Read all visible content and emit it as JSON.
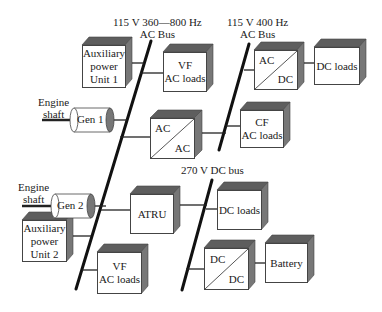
{
  "buses": {
    "vf_bus_label_1": "115 V 360—800 Hz",
    "vf_bus_label_2": "AC Bus",
    "cf_bus_label_1": "115 V 400 Hz",
    "cf_bus_label_2": "AC Bus",
    "dc_bus_label": "270 V DC bus"
  },
  "engines": {
    "engine1_line1": "Engine",
    "engine1_line2": "shaft",
    "engine2_line1": "Engine",
    "engine2_line2": "shaft"
  },
  "generators": {
    "gen1": "Gen 1",
    "gen2": "Gen 2"
  },
  "boxes": {
    "apu1_l1": "Auxiliary",
    "apu1_l2": "power",
    "apu1_l3": "Unit 1",
    "vf_loads_top_l1": "VF",
    "vf_loads_top_l2": "AC loads",
    "acdc_top": "AC",
    "acdc_bot": "DC",
    "dc_loads_top": "DC loads",
    "acac_top": "AC",
    "acac_bot": "AC",
    "cf_loads_l1": "CF",
    "cf_loads_l2": "AC loads",
    "atru": "ATRU",
    "dc_loads_mid": "DC loads",
    "apu2_l1": "Auxiliary",
    "apu2_l2": "power",
    "apu2_l3": "Unit 2",
    "vf_loads_bot_l1": "VF",
    "vf_loads_bot_l2": "AC loads",
    "dcdc_top": "DC",
    "dcdc_bot": "DC",
    "battery": "Battery"
  },
  "colors": {
    "line": "#111111",
    "box_side": "#6e6e6e",
    "box_top": "#5a5a5a",
    "box_border": "#444444"
  }
}
